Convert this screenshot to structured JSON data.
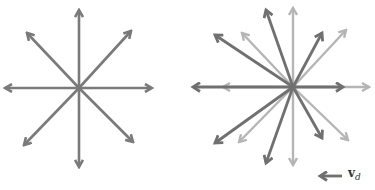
{
  "figure": {
    "left_panel": {
      "description": "Isotropic velocity distribution: 8 equal-length arrows from a common origin",
      "center": [
        79,
        88
      ],
      "arrow_color": "#7a7a7a",
      "tips": [
        [
          79,
          10
        ],
        [
          131,
          31
        ],
        [
          152,
          88
        ],
        [
          133,
          142
        ],
        [
          79,
          167
        ],
        [
          24,
          145
        ],
        [
          5,
          88
        ],
        [
          27,
          33
        ]
      ]
    },
    "right_panel": {
      "description": "Velocity distribution shifted by drift velocity: light (original) and dark (shifted) arrows",
      "center": [
        293,
        87
      ],
      "light_color": "#b5b5b5",
      "dark_color": "#707070",
      "light_tips": [
        [
          293,
          8
        ],
        [
          346,
          30
        ],
        [
          369,
          87
        ],
        [
          348,
          140
        ],
        [
          293,
          165
        ],
        [
          239,
          142
        ],
        [
          223,
          87
        ],
        [
          242,
          33
        ]
      ],
      "dark_tips": [
        [
          266,
          10
        ],
        [
          322,
          33
        ],
        [
          343,
          87
        ],
        [
          322,
          138
        ],
        [
          266,
          163
        ],
        [
          215,
          143
        ],
        [
          193,
          87
        ],
        [
          215,
          35
        ]
      ]
    },
    "legend": {
      "arrow_color": "#707070",
      "label_main": "v",
      "label_sub": "d"
    }
  }
}
